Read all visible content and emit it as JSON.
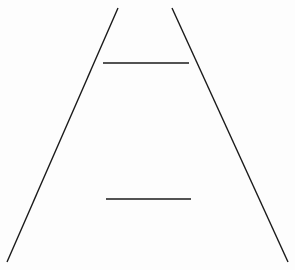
{
  "diagram": {
    "width": 295,
    "height": 270,
    "background": "#fdfdfd",
    "stroke_color": "#1a1a1a",
    "converging_lines": [
      {
        "name": "left-rail",
        "x1": 118,
        "y1": 8,
        "x2": 7,
        "y2": 262,
        "stroke_width": 1.4
      },
      {
        "name": "right-rail",
        "x1": 172,
        "y1": 8,
        "x2": 288,
        "y2": 262,
        "stroke_width": 1.4
      }
    ],
    "horizontal_bars": [
      {
        "name": "top-bar",
        "x1": 103,
        "y1": 63,
        "x2": 189,
        "y2": 63,
        "stroke_width": 1.6
      },
      {
        "name": "bottom-bar",
        "x1": 106,
        "y1": 199,
        "x2": 191,
        "y2": 199,
        "stroke_width": 1.6
      }
    ]
  }
}
